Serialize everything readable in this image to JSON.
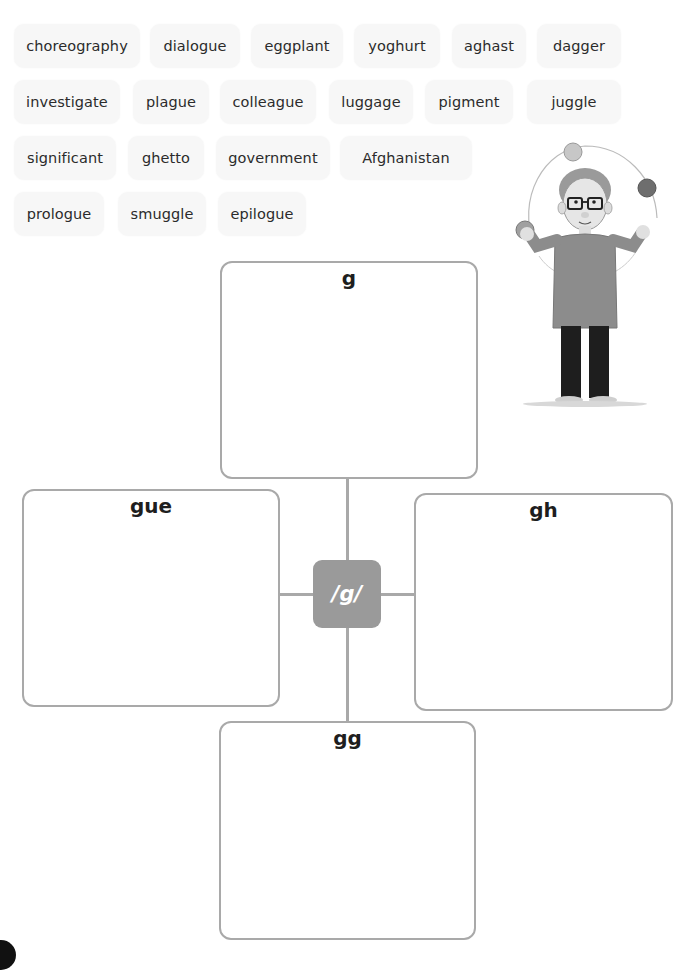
{
  "word_bank": {
    "rows": [
      [
        {
          "word": "choreography"
        },
        {
          "word": "dialogue"
        },
        {
          "word": "eggplant"
        },
        {
          "word": "yoghurt"
        },
        {
          "word": "aghast"
        },
        {
          "word": "dagger"
        }
      ],
      [
        {
          "word": "investigate"
        },
        {
          "word": "plague"
        },
        {
          "word": "colleague"
        },
        {
          "word": "luggage"
        },
        {
          "word": "pigment"
        },
        {
          "word": "juggle"
        }
      ],
      [
        {
          "word": "significant"
        },
        {
          "word": "ghetto"
        },
        {
          "word": "government"
        },
        {
          "word": "Afghanistan"
        }
      ],
      [
        {
          "word": "prologue"
        },
        {
          "word": "smuggle"
        },
        {
          "word": "epilogue"
        }
      ]
    ]
  },
  "illustration": {
    "description": "boy with glasses juggling three balls",
    "icon": "juggler-illustration"
  },
  "diagram": {
    "center_label": "/g/",
    "boxes": {
      "top": {
        "label": "g"
      },
      "left": {
        "label": "gue"
      },
      "right": {
        "label": "gh"
      },
      "bottom": {
        "label": "gg"
      }
    }
  },
  "colors": {
    "tile_bg": "#f7f7f7",
    "box_border": "#a9a9a9",
    "center_bg": "#9a9a9a",
    "text": "#2b2b2b"
  }
}
